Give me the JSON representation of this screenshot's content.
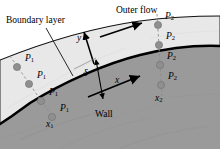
{
  "figure": {
    "labels": {
      "boundary_layer": "Boundary layer",
      "outer_flow": "Outer flow",
      "wall": "Wall",
      "delta": "δ",
      "y_axis": "y",
      "x_axis": "x",
      "station_1": "x",
      "station_1_sub": "1",
      "station_2": "x",
      "station_2_sub": "2",
      "pressure_1": "P",
      "pressure_1_sub": "1",
      "pressure_2": "P",
      "pressure_2_sub": "2"
    },
    "colors": {
      "wall_fill": "#9a9a9a",
      "boundary_layer_fill": "#e6e6e6",
      "outer_region_fill": "#ffffff",
      "probe_dot": "#8a8a8a",
      "probe_dot_stroke": "#6e6e6e",
      "line": "#000000",
      "wall_line": "#000000",
      "dashed_line": "#808080"
    },
    "probe_columns": [
      {
        "station": "x1",
        "label": "P1",
        "count": 4,
        "dots": [
          {
            "cx": 17,
            "cy": 67
          },
          {
            "cx": 29,
            "cy": 84
          },
          {
            "cx": 41,
            "cy": 101
          },
          {
            "cx": 52,
            "cy": 117
          }
        ],
        "text_positions": [
          {
            "x": 27,
            "y": 60
          },
          {
            "x": 39,
            "y": 77
          },
          {
            "x": 51,
            "y": 94
          },
          {
            "x": 62,
            "y": 110
          }
        ]
      },
      {
        "station": "x2",
        "label": "P2",
        "count": 4,
        "dots": [
          {
            "cx": 158,
            "cy": 25
          },
          {
            "cx": 159,
            "cy": 45
          },
          {
            "cx": 160,
            "cy": 65
          },
          {
            "cx": 161,
            "cy": 85
          }
        ],
        "text_positions": [
          {
            "x": 166,
            "y": 18
          },
          {
            "x": 167,
            "y": 38
          },
          {
            "x": 168,
            "y": 58
          },
          {
            "x": 169,
            "y": 78
          }
        ]
      }
    ],
    "annotations": {
      "delta_position": {
        "x": 86,
        "y": 74
      },
      "y_position": {
        "x": 80,
        "y": 38
      },
      "x_position": {
        "x": 118,
        "y": 80
      },
      "wall_position": {
        "x": 98,
        "y": 114
      },
      "boundary_layer_position": {
        "x": 8,
        "y": 16
      },
      "outer_flow_position": {
        "x": 118,
        "y": 6
      }
    }
  }
}
